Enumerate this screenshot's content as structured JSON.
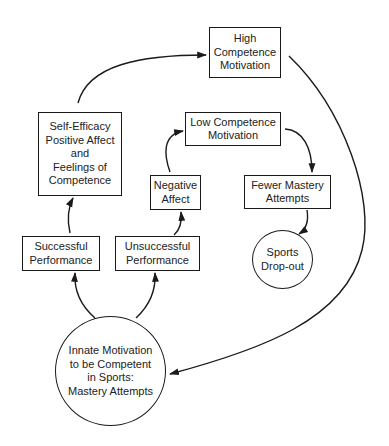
{
  "diagram": {
    "type": "flowchart",
    "colors": {
      "stroke": "#1a1a1a",
      "text": "#222222",
      "background": "#ffffff"
    },
    "nodes": {
      "high": {
        "label": "High\nCompetence\nMotivation",
        "shape": "rectangle"
      },
      "self_efficacy": {
        "label": "Self-Efficacy\nPositive Affect\nand\nFeelings of\nCompetence",
        "shape": "rectangle"
      },
      "low": {
        "label": "Low Competence\nMotivation",
        "shape": "rectangle"
      },
      "negative": {
        "label": "Negative\nAffect",
        "shape": "rectangle"
      },
      "fewer": {
        "label": "Fewer Mastery\nAttempts",
        "shape": "rectangle"
      },
      "successful": {
        "label": "Successful\nPerformance",
        "shape": "rectangle"
      },
      "unsuccessful": {
        "label": "Unsuccessful\nPerformance",
        "shape": "rectangle"
      },
      "dropout": {
        "label": "Sports\nDrop-out",
        "shape": "circle"
      },
      "innate": {
        "label": "Innate Motivation\nto be Competent\nin Sports:\nMastery Attempts",
        "shape": "circle"
      }
    },
    "edges": [
      {
        "from": "innate",
        "to": "successful"
      },
      {
        "from": "innate",
        "to": "unsuccessful"
      },
      {
        "from": "successful",
        "to": "self_efficacy"
      },
      {
        "from": "self_efficacy",
        "to": "high"
      },
      {
        "from": "high",
        "to": "innate"
      },
      {
        "from": "unsuccessful",
        "to": "negative"
      },
      {
        "from": "negative",
        "to": "low"
      },
      {
        "from": "low",
        "to": "fewer"
      },
      {
        "from": "fewer",
        "to": "dropout"
      }
    ]
  }
}
